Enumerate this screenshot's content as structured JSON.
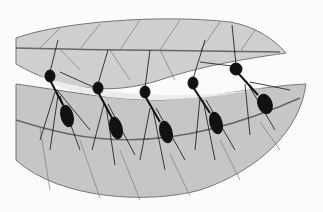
{
  "image": {
    "description": "Illustration of five weaver ants forming a living bridge between two leaves",
    "colors": {
      "background": "#fbfbfb",
      "leaf_fill": "#c9c9c9",
      "leaf_light": "#d8d8d8",
      "gap": "#ececec",
      "vein": "#6e6e6e",
      "ant": "#111111"
    },
    "ants": [
      {
        "head": [
          50,
          76
        ],
        "abdomen": [
          67,
          116
        ]
      },
      {
        "head": [
          98,
          88
        ],
        "abdomen": [
          116,
          128
        ]
      },
      {
        "head": [
          145,
          92
        ],
        "abdomen": [
          166,
          132
        ]
      },
      {
        "head": [
          193,
          83
        ],
        "abdomen": [
          216,
          123
        ]
      },
      {
        "head": [
          236,
          69
        ],
        "abdomen": [
          265,
          104
        ]
      }
    ]
  }
}
